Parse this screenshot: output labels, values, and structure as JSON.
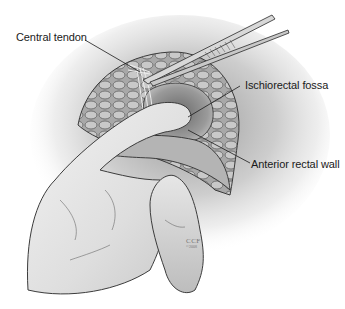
{
  "figure": {
    "type": "anatomical-illustration",
    "background": "#ffffff",
    "line_color": "#1a1a1a"
  },
  "labels": [
    {
      "id": "central-tendon",
      "text": "Central tendon",
      "x": 16,
      "y": 33,
      "leader": {
        "x1": 85,
        "y1": 40,
        "x2": 140,
        "y2": 72
      }
    },
    {
      "id": "ischiorectal-fossa",
      "text": "Ischiorectal fossa",
      "x": 245,
      "y": 80,
      "leader": {
        "x1": 240,
        "y1": 86,
        "x2": 188,
        "y2": 117
      }
    },
    {
      "id": "anterior-rectal-wall",
      "text": "Anterior rectal wall",
      "x": 251,
      "y": 156,
      "leader": {
        "x1": 250,
        "y1": 163,
        "x2": 188,
        "y2": 130
      }
    }
  ],
  "signature": {
    "main": "CCF",
    "year": "©2008"
  }
}
